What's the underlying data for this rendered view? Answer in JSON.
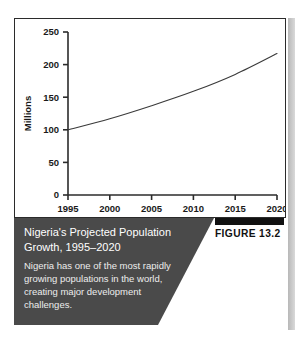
{
  "figure": {
    "badge_label": "FIGURE 13.2",
    "caption_title": "Nigeria's Projected Population Growth, 1995–2020",
    "caption_body": "Nigeria has one of the most rapidly growing populations in the world, creating major development challenges."
  },
  "colors": {
    "caption_background": "#4a4a4a",
    "caption_text": "#ffffff",
    "caption_body_text": "#ededed",
    "badge_bar": "#111111",
    "axis": "#2b2b2b",
    "line": "#3a3a3a",
    "plot_background": "#ffffff",
    "page_shadow": "#c4c4c4"
  },
  "chart_data": {
    "type": "line",
    "title": "",
    "xlabel": "",
    "ylabel": "Millions",
    "xlim": [
      1995,
      2020
    ],
    "ylim": [
      0,
      250
    ],
    "grid": false,
    "legend": false,
    "xticks": [
      "1995",
      "2000",
      "2005",
      "2010",
      "2015",
      "2020"
    ],
    "xtick_values": [
      1995,
      2000,
      2005,
      2010,
      2015,
      2020
    ],
    "yticks": [
      "0",
      "50",
      "100",
      "150",
      "200",
      "250"
    ],
    "ytick_values": [
      0,
      50,
      100,
      150,
      200,
      250
    ],
    "x": [
      1995,
      2000,
      2005,
      2010,
      2015,
      2020
    ],
    "values": [
      100,
      117,
      137,
      159,
      185,
      217
    ],
    "series": [
      {
        "name": "Nigeria projected population",
        "values": [
          100,
          117,
          137,
          159,
          185,
          217
        ]
      }
    ]
  }
}
